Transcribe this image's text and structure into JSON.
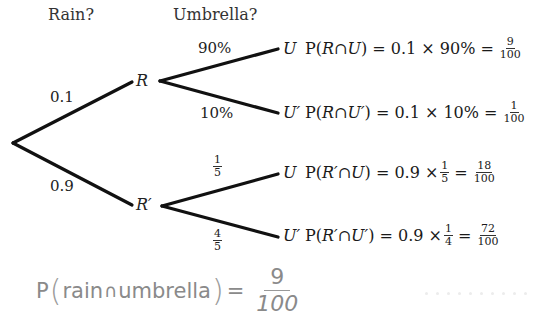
{
  "headers": {
    "rain": "Rain?",
    "umbrella": "Umbrella?"
  },
  "tree": {
    "root_branches": [
      {
        "to": "R",
        "prob": "0.1"
      },
      {
        "to": "R′",
        "prob": "0.9"
      }
    ],
    "nodes": {
      "R": "R",
      "R_prime": "R′"
    },
    "R_branches": [
      {
        "to": "U",
        "prob": "90%"
      },
      {
        "to": "U′",
        "prob": "10%"
      }
    ],
    "R_prime_branches": [
      {
        "to": "U",
        "prob_num": "1",
        "prob_den": "5"
      },
      {
        "to": "U′",
        "prob_num": "4",
        "prob_den": "5"
      }
    ]
  },
  "outcomes": [
    {
      "leaf": "U",
      "lhs": "P(",
      "a": "R",
      "cap": " ∩ ",
      "b": "U",
      "rhs": ") = 0.1 × 90% =",
      "num": "9",
      "den": "100"
    },
    {
      "leaf": "U′",
      "lhs": "P(",
      "a": "R",
      "cap": " ∩ ",
      "b": "U′",
      "rhs": ") = 0.1 × 10% =",
      "num": "1",
      "den": "100"
    },
    {
      "leaf": "U",
      "lhs": "P(",
      "a": "R′",
      "cap": " ∩ ",
      "b": "U",
      "rhs": ") = 0.9 ×",
      "mid_num": "1",
      "mid_den": "5",
      "eq": "=",
      "num": "18",
      "den": "100"
    },
    {
      "leaf": "U′",
      "lhs": "P(",
      "a": "R′",
      "cap": " ∩ ",
      "b": "U′",
      "rhs": ") = 0.9 ×",
      "mid_num": "1",
      "mid_den": "4",
      "eq": "=",
      "num": "72",
      "den": "100"
    }
  ],
  "handwritten": {
    "p": "P",
    "open": "(",
    "text1": "rain",
    "cap": "∩",
    "text2": "umbrella",
    "close": ")",
    "eq": "=",
    "num": "9",
    "den": "100"
  },
  "colors": {
    "line": "#111111",
    "text": "#1a1a1a",
    "handwritten": "#8a8a8a"
  }
}
